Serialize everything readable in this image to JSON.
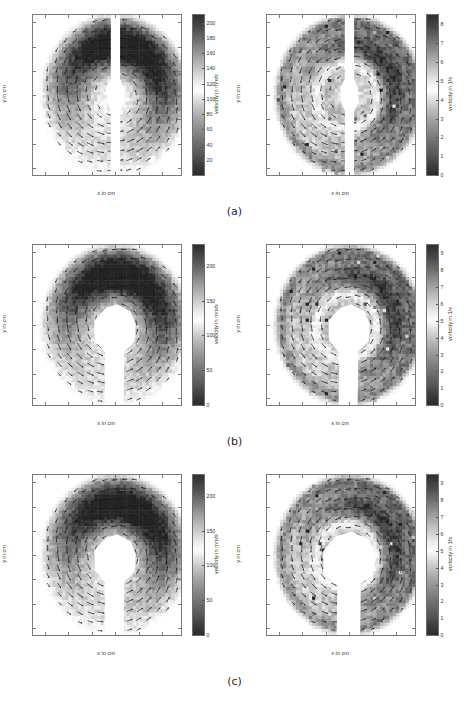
{
  "figure": {
    "panel_captions": [
      "(a)",
      "(b)",
      "(c)"
    ]
  },
  "axes_common": {
    "xlabel": "x in cm",
    "ylabel": "y in cm",
    "xticks": [
      "-6",
      "-4",
      "-2",
      "0",
      "2",
      "4"
    ],
    "xtick_values": [
      -6,
      -4,
      -2,
      0,
      2,
      4
    ],
    "yticks": [
      "6",
      "4",
      "2",
      "0",
      "-2",
      "-4",
      "-6"
    ],
    "ytick_values": [
      6,
      4,
      2,
      0,
      -2,
      -4,
      -6
    ],
    "xlim": [
      -7,
      5.6
    ],
    "ylim": [
      -6.6,
      6.6
    ]
  },
  "chart_data": {
    "type": "heatmap",
    "xlabel": "x in cm",
    "ylabel": "y in cm",
    "xlim": [
      -7,
      5.6
    ],
    "ylim": [
      -6.6,
      6.6
    ],
    "grid": false,
    "colormap": "grayscale-jet",
    "panels": [
      {
        "row": "a",
        "side": "left",
        "quantity": "velocity",
        "cbar_label": "velocity in mm/s",
        "cbar_ticks": [
          "200",
          "180",
          "160",
          "140",
          "120",
          "100",
          "80",
          "60",
          "40",
          "20"
        ],
        "cbar_tick_values": [
          200,
          180,
          160,
          140,
          120,
          100,
          80,
          60,
          40,
          20
        ],
        "clim": [
          0,
          210
        ],
        "void_shape": "narrow-vertical-slit"
      },
      {
        "row": "a",
        "side": "right",
        "quantity": "vorticity",
        "cbar_label": "vorticity in 1/s",
        "cbar_ticks": [
          "8",
          "7",
          "6",
          "5",
          "4",
          "3",
          "2",
          "1",
          "0"
        ],
        "cbar_tick_values": [
          8,
          7,
          6,
          5,
          4,
          3,
          2,
          1,
          0
        ],
        "clim": [
          0,
          8.5
        ],
        "void_shape": "narrow-vertical-slit"
      },
      {
        "row": "b",
        "side": "left",
        "quantity": "velocity",
        "cbar_label": "velocity in mm/s",
        "cbar_ticks": [
          "200",
          "150",
          "100",
          "50",
          "0"
        ],
        "cbar_tick_values": [
          200,
          150,
          100,
          50,
          0
        ],
        "clim": [
          0,
          230
        ],
        "void_shape": "keyhole"
      },
      {
        "row": "b",
        "side": "right",
        "quantity": "vorticity",
        "cbar_label": "vorticity in 1/s",
        "cbar_ticks": [
          "9",
          "8",
          "7",
          "6",
          "5",
          "4",
          "3",
          "2",
          "1",
          "0"
        ],
        "cbar_tick_values": [
          9,
          8,
          7,
          6,
          5,
          4,
          3,
          2,
          1,
          0
        ],
        "clim": [
          0,
          9.5
        ],
        "void_shape": "keyhole"
      },
      {
        "row": "c",
        "side": "left",
        "quantity": "velocity",
        "cbar_label": "velocity in mm/s",
        "cbar_ticks": [
          "200",
          "150",
          "100",
          "50",
          "0"
        ],
        "cbar_tick_values": [
          200,
          150,
          100,
          50,
          0
        ],
        "clim": [
          0,
          230
        ],
        "void_shape": "keyhole"
      },
      {
        "row": "c",
        "side": "right",
        "quantity": "vorticity",
        "cbar_label": "vorticity in 1/s",
        "cbar_ticks": [
          "9",
          "8",
          "7",
          "6",
          "5",
          "4",
          "3",
          "2",
          "1",
          "0"
        ],
        "cbar_tick_values": [
          9,
          8,
          7,
          6,
          5,
          4,
          3,
          2,
          1,
          0
        ],
        "clim": [
          0,
          9.5
        ],
        "void_shape": "keyhole-wide"
      }
    ]
  }
}
